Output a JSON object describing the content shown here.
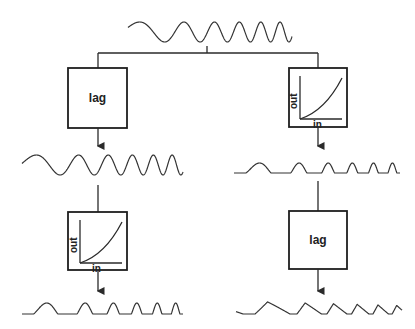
{
  "diagram": {
    "title": "",
    "input_signal": {
      "name": "chirp sine wave (increasing frequency)"
    },
    "left_branch": {
      "block1": {
        "type": "lag",
        "label": "lag"
      },
      "mid_signal": {
        "name": "lagged sine wave"
      },
      "block2": {
        "type": "nonlinear",
        "axis_y": "out",
        "axis_x": "in"
      },
      "output_signal": {
        "name": "rectified peaks"
      }
    },
    "right_branch": {
      "block1": {
        "type": "nonlinear",
        "axis_y": "out",
        "axis_x": "in"
      },
      "mid_signal": {
        "name": "rectified peaks"
      },
      "block2": {
        "type": "lag",
        "label": "lag"
      },
      "output_signal": {
        "name": "lagged sawtooth-like wave"
      }
    }
  },
  "colors": {
    "ink": "#2a2a2a",
    "background": "#ffffff"
  }
}
